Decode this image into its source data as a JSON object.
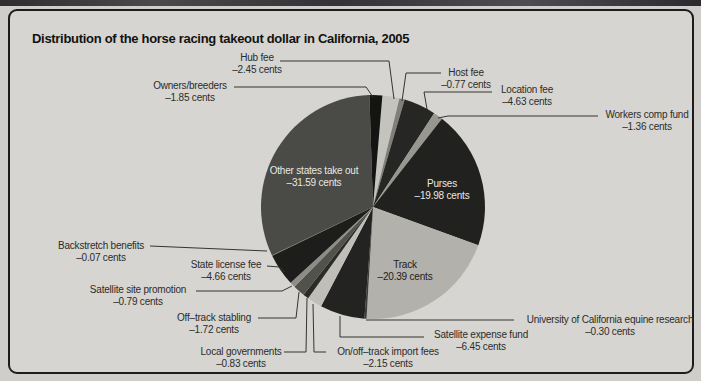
{
  "page": {
    "title": "Distribution of the horse racing takeout dollar in California, 2005"
  },
  "chart_data": {
    "type": "pie",
    "title": "Distribution of the horse racing takeout dollar in California, 2005",
    "unit": "cents per takeout dollar",
    "total_cents": 99.99,
    "start_angle_deg": 4.85,
    "center": {
      "x": 373,
      "y": 207
    },
    "radius": 112,
    "leader_line_color": "#35342f",
    "slices": [
      {
        "label": "Hub fee",
        "value": 2.45,
        "value_text": "–2.45 cents",
        "color": "#c4c3bd",
        "callout": {
          "type": "outside",
          "cx": 257,
          "y": 52,
          "leader": [
            [
              280,
              61
            ],
            [
              389,
              61
            ],
            [
              394,
              99
            ]
          ]
        }
      },
      {
        "label": "Host fee",
        "value": 0.77,
        "value_text": "–0.77 cents",
        "color": "#807f79",
        "callout": {
          "type": "outside",
          "cx": 466,
          "y": 67,
          "leader": [
            [
              441,
              73
            ],
            [
              406,
              73
            ],
            [
              402,
              101
            ]
          ]
        }
      },
      {
        "label": "Location fee",
        "value": 4.63,
        "value_text": "–4.63 cents",
        "color": "#262624",
        "callout": {
          "type": "outside",
          "cx": 527,
          "y": 84,
          "leader": [
            [
              492,
              92
            ],
            [
              424,
              92
            ],
            [
              427,
              109
            ]
          ]
        }
      },
      {
        "label": "Workers comp fund",
        "value": 1.36,
        "value_text": "–1.36 cents",
        "color": "#97968f",
        "callout": {
          "type": "outside",
          "cx": 647,
          "y": 109,
          "leader": [
            [
              598,
              116
            ],
            [
              448,
              116
            ],
            [
              438,
              118
            ]
          ]
        }
      },
      {
        "label": "Purses",
        "value": 19.98,
        "value_text": "–19.98 cents",
        "color": "#21211f",
        "callout": {
          "type": "inside",
          "cx": 442,
          "y": 178,
          "text_color": "#e9e8e3"
        }
      },
      {
        "label": "Track",
        "value": 20.39,
        "value_text": "–20.39 cents",
        "color": "#b2b1ab",
        "callout": {
          "type": "inside",
          "cx": 405,
          "y": 259,
          "text_color": "#1c1c1a"
        }
      },
      {
        "label": "University of California equine research",
        "value": 0.3,
        "value_text": "–0.30 cents",
        "color": "#3c3c38",
        "callout": {
          "type": "outside",
          "cx": 610,
          "y": 314,
          "leader": [
            [
              514,
              320
            ],
            [
              366,
              320
            ]
          ]
        }
      },
      {
        "label": "Satellite expense fund",
        "value": 6.45,
        "value_text": "–6.45 cents",
        "color": "#232321",
        "callout": {
          "type": "outside",
          "cx": 481,
          "y": 329,
          "leader": [
            [
              424,
              337
            ],
            [
              340,
              337
            ],
            [
              340,
              316
            ]
          ]
        }
      },
      {
        "label": "On/off–track import fees",
        "value": 2.15,
        "value_text": "–2.15 cents",
        "color": "#bfbeb8",
        "callout": {
          "type": "outside",
          "cx": 388,
          "y": 346,
          "leader": [
            [
              326,
              352
            ],
            [
              314,
              352
            ],
            [
              313,
              304
            ]
          ]
        }
      },
      {
        "label": "Local governments",
        "value": 0.83,
        "value_text": "–0.83 cents",
        "color": "#2b2b29",
        "callout": {
          "type": "outside",
          "cx": 241,
          "y": 346,
          "leader": [
            [
              284,
              352
            ],
            [
              306,
              352
            ],
            [
              307,
              298
            ]
          ]
        }
      },
      {
        "label": "Off–track stabling",
        "value": 1.72,
        "value_text": "–1.72 cents",
        "color": "#52524c",
        "callout": {
          "type": "outside",
          "cx": 214,
          "y": 312,
          "leader": [
            [
              258,
              318
            ],
            [
              296,
              318
            ],
            [
              299,
              292
            ]
          ]
        }
      },
      {
        "label": "Satellite site promotion",
        "value": 0.79,
        "value_text": "–0.79 cents",
        "color": "#8d8c86",
        "callout": {
          "type": "outside",
          "cx": 138,
          "y": 284,
          "leader": [
            [
              196,
              291
            ],
            [
              282,
              291
            ],
            [
              292,
              286
            ]
          ]
        }
      },
      {
        "label": "State license fee",
        "value": 4.66,
        "value_text": "–4.66 cents",
        "color": "#1d1d1b",
        "callout": {
          "type": "outside",
          "cx": 226,
          "y": 259,
          "leader": [
            [
              267,
              266
            ],
            [
              279,
              267
            ],
            [
              285,
              272
            ]
          ]
        }
      },
      {
        "label": "Backstretch benefits",
        "value": 0.07,
        "value_text": "–0.07 cents",
        "color": "#6a6a64",
        "callout": {
          "type": "outside",
          "cx": 101,
          "y": 240,
          "leader": [
            [
              150,
              246
            ],
            [
              267,
              251
            ]
          ]
        }
      },
      {
        "label": "Other states take out",
        "value": 31.59,
        "value_text": "–31.59 cents",
        "color": "#4a4a46",
        "callout": {
          "type": "inside",
          "cx": 314,
          "y": 165,
          "text_color": "#e9e8e3"
        }
      },
      {
        "label": "Owners/breeders",
        "value": 1.85,
        "value_text": "–1.85 cents",
        "color": "#141412",
        "callout": {
          "type": "outside",
          "cx": 190,
          "y": 80,
          "leader": [
            [
              234,
              87
            ],
            [
              366,
              87
            ],
            [
              373,
              97
            ]
          ]
        }
      }
    ]
  }
}
